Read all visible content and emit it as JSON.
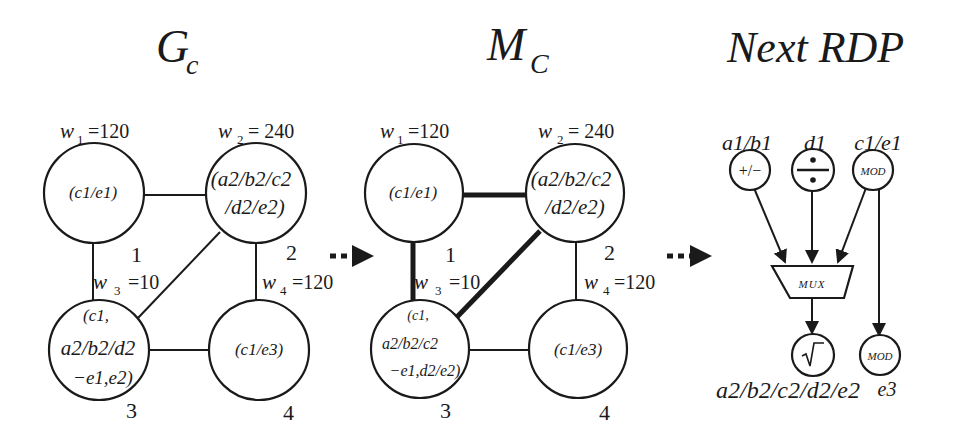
{
  "titles": {
    "gc": {
      "main": "G",
      "sub": "c"
    },
    "mc": {
      "main": "M",
      "sub": "C"
    },
    "rdp": "Next RDP"
  },
  "gc_graph": {
    "weights": {
      "w1": {
        "sym": "w",
        "idx": "1",
        "val": "=120"
      },
      "w2": {
        "sym": "w",
        "idx": "2",
        "val": "= 240"
      },
      "w3": {
        "sym": "w",
        "idx": "3",
        "val": "=10"
      },
      "w4": {
        "sym": "w",
        "idx": "4",
        "val": "=120"
      }
    },
    "nodes": [
      {
        "id": "1",
        "lines": [
          "(c1/e1)"
        ]
      },
      {
        "id": "2",
        "lines": [
          "(a2/b2/c2",
          "/d2/e2)"
        ]
      },
      {
        "id": "3",
        "lines": [
          "(c1,",
          "a2/b2/d2",
          "−e1,e2)"
        ]
      },
      {
        "id": "4",
        "lines": [
          "(c1/e3)"
        ]
      }
    ],
    "edges": [
      [
        "1",
        "2"
      ],
      [
        "1",
        "3"
      ],
      [
        "2",
        "3"
      ],
      [
        "2",
        "4"
      ],
      [
        "3",
        "4"
      ]
    ]
  },
  "mc_graph": {
    "weights": {
      "w1": {
        "sym": "w",
        "idx": "1",
        "val": "=120"
      },
      "w2": {
        "sym": "w",
        "idx": "2",
        "val": "= 240"
      },
      "w3": {
        "sym": "w",
        "idx": "3",
        "val": "=10"
      },
      "w4": {
        "sym": "w",
        "idx": "4",
        "val": "=120"
      }
    },
    "nodes": [
      {
        "id": "1",
        "lines": [
          "(c1/e1)"
        ]
      },
      {
        "id": "2",
        "lines": [
          "(a2/b2/c2",
          "/d2/e2)"
        ]
      },
      {
        "id": "3",
        "lines": [
          "(c1,",
          "a2/b2/c2",
          "−e1,d2/e2)"
        ]
      },
      {
        "id": "4",
        "lines": [
          "(c1/e3)"
        ]
      }
    ],
    "thick_edges": [
      [
        "1",
        "2"
      ],
      [
        "1",
        "3"
      ],
      [
        "2",
        "3"
      ]
    ],
    "thin_edges": [
      [
        "2",
        "4"
      ],
      [
        "3",
        "4"
      ]
    ]
  },
  "rdp": {
    "inputs": [
      {
        "label": "a1/b1",
        "op": "+/−"
      },
      {
        "label": "d1",
        "op": "÷"
      },
      {
        "label": "c1/e1",
        "op": "MOD"
      }
    ],
    "mux_label": "MUX",
    "outputs": [
      {
        "op": "√",
        "label": "a2/b2/c2/d2/e2"
      },
      {
        "op": "MOD",
        "label": "e3"
      }
    ]
  }
}
